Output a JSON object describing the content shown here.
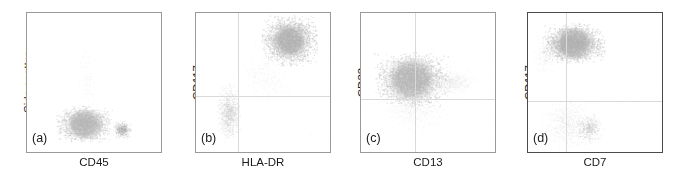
{
  "figure": {
    "type": "flow-cytometry-scatter-panels",
    "panel_count": 4,
    "background": "#ffffff",
    "frame_color": "#9a9a9a",
    "crosshair_color": "#d9d9d9",
    "dot_color": "#a8a8a8"
  },
  "chart_data": [
    {
      "type": "scatter",
      "panel_label": "(a)",
      "title": "",
      "xlabel": "CD45",
      "ylabel": "Side scatter",
      "xlim": [
        0,
        1
      ],
      "ylim": [
        0,
        1
      ],
      "grid": false,
      "quadrant_lines": {
        "show": false,
        "x": null,
        "y": null
      },
      "legend": null,
      "clusters": [
        {
          "name": "main-blast-population",
          "cx": 0.43,
          "cy": 0.2,
          "rx": 0.16,
          "ry": 0.1,
          "n": 2600,
          "density": "high",
          "shade": "#b6b6b6"
        },
        {
          "name": "lymphocyte-population",
          "cx": 0.71,
          "cy": 0.16,
          "rx": 0.055,
          "ry": 0.05,
          "n": 500,
          "density": "medium",
          "shade": "#a5a5a5"
        },
        {
          "name": "sparse-upper-tail",
          "cx": 0.45,
          "cy": 0.52,
          "rx": 0.06,
          "ry": 0.22,
          "n": 180,
          "density": "low",
          "shade": "#d2d2d2"
        }
      ]
    },
    {
      "type": "scatter",
      "panel_label": "(b)",
      "title": "",
      "xlabel": "HLA-DR",
      "ylabel": "CD117",
      "xlim": [
        0,
        1
      ],
      "ylim": [
        0,
        1
      ],
      "grid": false,
      "quadrant_lines": {
        "show": true,
        "x": 0.31,
        "y": 0.4
      },
      "legend": null,
      "clusters": [
        {
          "name": "cd117-pos-hladr-pos-cluster",
          "cx": 0.7,
          "cy": 0.8,
          "rx": 0.16,
          "ry": 0.14,
          "n": 3000,
          "density": "high",
          "shade": "#b0b0b0"
        },
        {
          "name": "cd117-neg-hladr-neg-cluster",
          "cx": 0.25,
          "cy": 0.28,
          "rx": 0.07,
          "ry": 0.16,
          "n": 900,
          "density": "medium",
          "shade": "#bdbdbd"
        },
        {
          "name": "bridge-scatter",
          "cx": 0.52,
          "cy": 0.52,
          "rx": 0.15,
          "ry": 0.16,
          "n": 350,
          "density": "low",
          "shade": "#cccccc"
        }
      ]
    },
    {
      "type": "scatter",
      "panel_label": "(c)",
      "title": "",
      "xlabel": "CD13",
      "ylabel": "CD33",
      "xlim": [
        0,
        1
      ],
      "ylim": [
        0,
        1
      ],
      "grid": false,
      "quadrant_lines": {
        "show": true,
        "x": 0.4,
        "y": 0.38
      },
      "legend": null,
      "clusters": [
        {
          "name": "cd33-pos-cd13-dim-cluster",
          "cx": 0.38,
          "cy": 0.52,
          "rx": 0.22,
          "ry": 0.15,
          "n": 3600,
          "density": "high",
          "shade": "#b4b4b4"
        },
        {
          "name": "cd13-bright-tail",
          "cx": 0.7,
          "cy": 0.5,
          "rx": 0.13,
          "ry": 0.07,
          "n": 600,
          "density": "low",
          "shade": "#c9c9c9"
        },
        {
          "name": "lower-halo",
          "cx": 0.4,
          "cy": 0.3,
          "rx": 0.2,
          "ry": 0.12,
          "n": 700,
          "density": "low",
          "shade": "#d0d0d0"
        }
      ]
    },
    {
      "type": "scatter",
      "panel_label": "(d)",
      "title": "",
      "xlabel": "CD7",
      "ylabel": "CD117",
      "xlim": [
        0,
        1
      ],
      "ylim": [
        0,
        1
      ],
      "grid": false,
      "quadrant_lines": {
        "show": true,
        "x": 0.28,
        "y": 0.37
      },
      "legend": null,
      "clusters": [
        {
          "name": "cd117-pos-cd7-neg-cluster",
          "cx": 0.34,
          "cy": 0.78,
          "rx": 0.18,
          "ry": 0.11,
          "n": 3200,
          "density": "high",
          "shade": "#b0b0b0"
        },
        {
          "name": "cd117-neg-scatter",
          "cx": 0.3,
          "cy": 0.2,
          "rx": 0.17,
          "ry": 0.14,
          "n": 900,
          "density": "low",
          "shade": "#c4c4c4"
        },
        {
          "name": "cd7-dim-cluster",
          "cx": 0.46,
          "cy": 0.17,
          "rx": 0.08,
          "ry": 0.09,
          "n": 450,
          "density": "medium",
          "shade": "#b8b8b8"
        },
        {
          "name": "left-edge-tail",
          "cx": 0.12,
          "cy": 0.7,
          "rx": 0.07,
          "ry": 0.12,
          "n": 250,
          "density": "low",
          "shade": "#cfcfcf"
        }
      ]
    }
  ]
}
